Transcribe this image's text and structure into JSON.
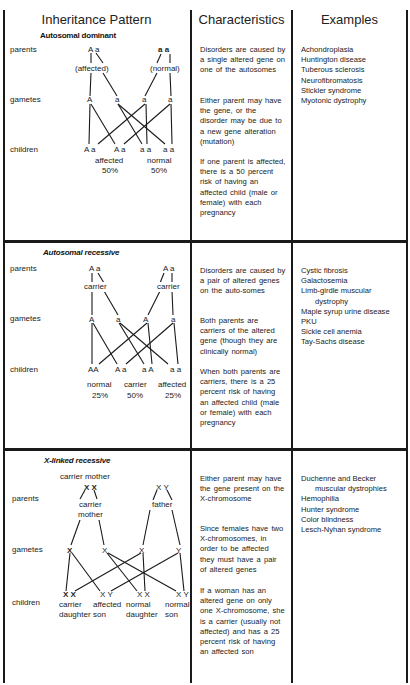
{
  "headers": {
    "pattern": "Inheritance Pattern",
    "characteristics": "Characteristics",
    "examples": "Examples"
  },
  "row_labels": {
    "parents": "parents",
    "gametes": "gametes",
    "children": "children"
  },
  "sections": [
    {
      "title": "Autosomal dominant",
      "diagram": {
        "parent1": "A a",
        "parent1_label": "(affected)",
        "parent2": "a a",
        "parent2_label": "(normal)",
        "gametes": [
          "A",
          "a",
          "a",
          "a"
        ],
        "children": [
          "A a",
          "A a",
          "a a",
          "a a"
        ],
        "outcomes": [
          {
            "label": "affected",
            "percent": "50%"
          },
          {
            "label": "normal",
            "percent": "50%"
          }
        ]
      },
      "characteristics": [
        "Disorders are caused by a single altered gene on one of the autosomes",
        "Either parent may have the gene, or the disorder may be due to a new gene alteration (mutation)",
        "If one parent is affected, there is a 50 percent risk of having an affected child (male or female) with each pregnancy"
      ],
      "examples": [
        {
          "text": "Achondroplasia"
        },
        {
          "text": "Huntington disease"
        },
        {
          "text": "Tuberous sclerosis"
        },
        {
          "text": "Neurofibromatosis"
        },
        {
          "text": "Stickler syndrome"
        },
        {
          "text": "Myotonic dystrophy"
        }
      ]
    },
    {
      "title": "Autosomal recessive",
      "diagram": {
        "parent1": "A a",
        "parent1_label": "carrier",
        "parent2": "A a",
        "parent2_label": "carrier",
        "gametes": [
          "A",
          "a",
          "A",
          "a"
        ],
        "children": [
          "AA",
          "A a",
          "a A",
          "a a"
        ],
        "outcomes": [
          {
            "label": "normal",
            "percent": "25%"
          },
          {
            "label": "carrier",
            "percent": "50%"
          },
          {
            "label": "affected",
            "percent": "25%"
          }
        ]
      },
      "characteristics": [
        "Disorders are caused by a pair of altered genes on the auto-somes",
        "Both parents are carriers of the altered gene (though they are clinically normal)",
        "When both parents are carriers, there is a 25 percent risk of having an affected child (male or female) with each pregnancy"
      ],
      "examples": [
        {
          "text": "Cystic fibrosis"
        },
        {
          "text": "Galactosemia"
        },
        {
          "text": "Limb-girdle muscular"
        },
        {
          "text": "dystrophy",
          "indent": true
        },
        {
          "text": "Maple syrup urine disease"
        },
        {
          "text": "PKU"
        },
        {
          "text": "Sickle cell anemia"
        },
        {
          "text": "Tay-Sachs disease"
        }
      ]
    },
    {
      "title": "X-linked recessive",
      "diagram": {
        "parent1_top_label": "carrier mother",
        "parent1": "X X",
        "parent1_label_line1": "carrier",
        "parent1_label_line2": "mother",
        "parent2": "X Y",
        "parent2_label": "father",
        "gametes": [
          "X",
          "X",
          "X",
          "Y"
        ],
        "children": [
          "X X",
          "X Y",
          "X X",
          "X Y"
        ],
        "outcomes": [
          {
            "line1": "carrier",
            "line2": "daughter"
          },
          {
            "line1": "affected",
            "line2": "son"
          },
          {
            "line1": "normal",
            "line2": "daughter"
          },
          {
            "line1": "normal",
            "line2": "son"
          }
        ]
      },
      "characteristics": [
        "Either parent may have the gene present on the X-chromosome",
        "Since females have two X-chromosomes, in order to be affected they must have a pair of altered genes",
        "If a woman has an altered gene on only one X-chromosome, she is a carrier (usually not affected) and has a 25 percent risk of having an affected son"
      ],
      "examples": [
        {
          "text": "Duchenne and Becker"
        },
        {
          "text": "muscular dystrophies",
          "indent": true
        },
        {
          "text": "Hemophilia"
        },
        {
          "text": "Hunter syndrome"
        },
        {
          "text": "Color blindness"
        },
        {
          "text": "Lesch-Nyhan syndrome"
        }
      ]
    }
  ]
}
